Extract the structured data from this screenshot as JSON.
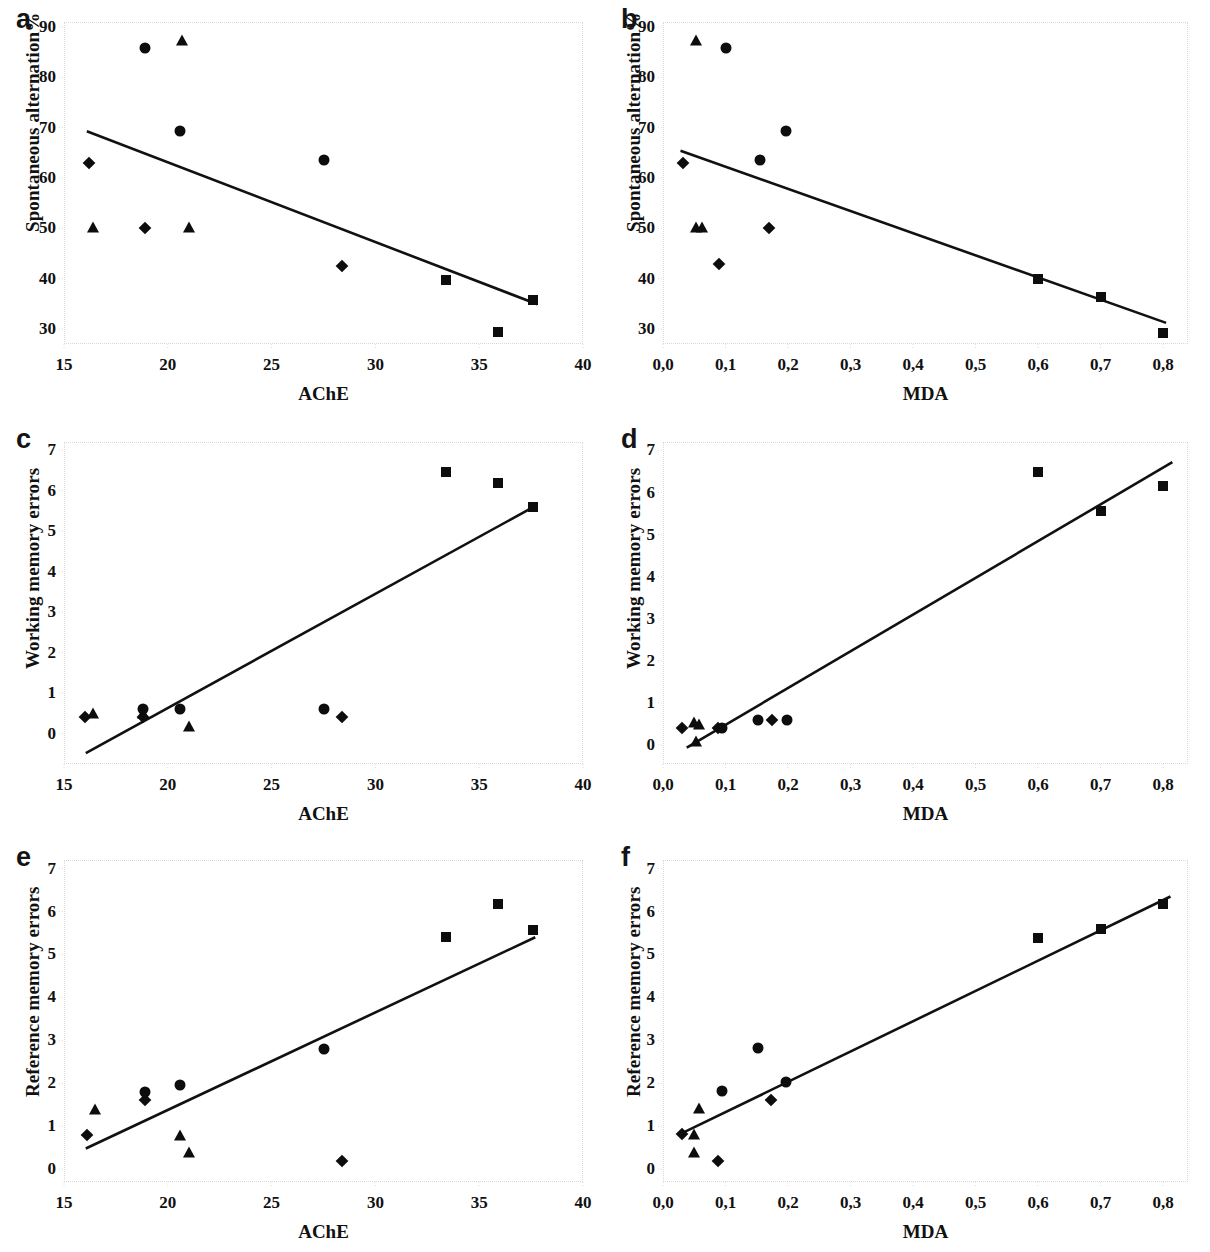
{
  "figure": {
    "panel_count": 6,
    "background_color": "#ffffff",
    "marker_color": "#0d0d0d",
    "line_color": "#111111",
    "frame_color": "#d9d9d9"
  },
  "chart_data": [
    {
      "panel": "a",
      "type": "scatter",
      "title": "",
      "xlabel": "AChE",
      "ylabel": "Spontaneous alternation%",
      "xlim": [
        15,
        40
      ],
      "ylim": [
        27,
        91
      ],
      "xticks": [
        15,
        20,
        25,
        30,
        35,
        40
      ],
      "xticklabels": [
        "15",
        "20",
        "25",
        "30",
        "35",
        "40"
      ],
      "yticks": [
        30,
        40,
        50,
        60,
        70,
        80,
        90
      ],
      "yticklabels": [
        "30",
        "40",
        "50",
        "60",
        "70",
        "80",
        "90"
      ],
      "grid": false,
      "legend": "none",
      "series": [
        {
          "name": "diamond",
          "marker": "diamond",
          "points": [
            [
              16.2,
              63.0
            ],
            [
              18.9,
              50.1
            ],
            [
              28.4,
              42.6
            ]
          ]
        },
        {
          "name": "triangle",
          "marker": "triangle",
          "points": [
            [
              16.4,
              50.2
            ],
            [
              20.7,
              87.4
            ],
            [
              21.0,
              50.2
            ]
          ]
        },
        {
          "name": "circle",
          "marker": "circle",
          "points": [
            [
              18.9,
              85.8
            ],
            [
              20.6,
              69.3
            ],
            [
              27.5,
              63.5
            ]
          ]
        },
        {
          "name": "square",
          "marker": "square",
          "points": [
            [
              33.4,
              39.8
            ],
            [
              35.9,
              29.3
            ],
            [
              37.6,
              35.8
            ]
          ]
        }
      ],
      "trendline": {
        "x1": 16.1,
        "y1": 69.3,
        "x2": 37.8,
        "y2": 34.9
      }
    },
    {
      "panel": "b",
      "type": "scatter",
      "title": "",
      "xlabel": "MDA",
      "ylabel": "Spontaneous alternation%",
      "xlim": [
        0.0,
        0.84
      ],
      "ylim": [
        27,
        91
      ],
      "xticks": [
        0.0,
        0.1,
        0.2,
        0.3,
        0.4,
        0.5,
        0.6,
        0.7,
        0.8
      ],
      "xticklabels": [
        "0,0",
        "0,1",
        "0,2",
        "0,3",
        "0,4",
        "0,5",
        "0,6",
        "0,7",
        "0,8"
      ],
      "yticks": [
        30,
        40,
        50,
        60,
        70,
        80,
        90
      ],
      "yticklabels": [
        "30",
        "40",
        "50",
        "60",
        "70",
        "80",
        "90"
      ],
      "grid": false,
      "legend": "none",
      "series": [
        {
          "name": "diamond",
          "marker": "diamond",
          "points": [
            [
              0.032,
              63.0
            ],
            [
              0.09,
              43.0
            ],
            [
              0.17,
              50.1
            ]
          ]
        },
        {
          "name": "triangle",
          "marker": "triangle",
          "points": [
            [
              0.052,
              87.5
            ],
            [
              0.052,
              50.2
            ],
            [
              0.063,
              50.2
            ]
          ]
        },
        {
          "name": "circle",
          "marker": "circle",
          "points": [
            [
              0.1,
              85.9
            ],
            [
              0.155,
              63.6
            ],
            [
              0.196,
              69.3
            ]
          ]
        },
        {
          "name": "square",
          "marker": "square",
          "points": [
            [
              0.6,
              40.0
            ],
            [
              0.7,
              36.3
            ],
            [
              0.8,
              29.2
            ]
          ]
        }
      ],
      "trendline": {
        "x1": 0.028,
        "y1": 65.4,
        "x2": 0.805,
        "y2": 31.2
      }
    },
    {
      "panel": "c",
      "type": "scatter",
      "title": "",
      "xlabel": "AChE",
      "ylabel": "Working memory errors",
      "xlim": [
        15,
        40
      ],
      "ylim": [
        -0.75,
        7.2
      ],
      "xticks": [
        15,
        20,
        25,
        30,
        35,
        40
      ],
      "xticklabels": [
        "15",
        "20",
        "25",
        "30",
        "35",
        "40"
      ],
      "yticks": [
        0,
        1,
        2,
        3,
        4,
        5,
        6,
        7
      ],
      "yticklabels": [
        "0",
        "1",
        "2",
        "3",
        "4",
        "5",
        "6",
        "7"
      ],
      "grid": false,
      "legend": "none",
      "series": [
        {
          "name": "diamond",
          "marker": "diamond",
          "points": [
            [
              16.0,
              0.4
            ],
            [
              18.8,
              0.4
            ],
            [
              28.4,
              0.4
            ]
          ]
        },
        {
          "name": "triangle",
          "marker": "triangle",
          "points": [
            [
              16.4,
              0.5
            ],
            [
              18.8,
              0.5
            ],
            [
              21.0,
              0.2
            ]
          ]
        },
        {
          "name": "circle",
          "marker": "circle",
          "points": [
            [
              18.8,
              0.6
            ],
            [
              20.6,
              0.6
            ],
            [
              27.5,
              0.6
            ]
          ]
        },
        {
          "name": "square",
          "marker": "square",
          "points": [
            [
              33.4,
              6.45
            ],
            [
              35.9,
              6.2
            ],
            [
              37.6,
              5.6
            ]
          ]
        }
      ],
      "trendline": {
        "x1": 16.05,
        "y1": -0.48,
        "x2": 37.7,
        "y2": 5.62
      }
    },
    {
      "panel": "d",
      "type": "scatter",
      "title": "",
      "xlabel": "MDA",
      "ylabel": "Working memory errors",
      "xlim": [
        0.0,
        0.84
      ],
      "ylim": [
        -0.45,
        7.2
      ],
      "xticks": [
        0.0,
        0.1,
        0.2,
        0.3,
        0.4,
        0.5,
        0.6,
        0.7,
        0.8
      ],
      "xticklabels": [
        "0,0",
        "0,1",
        "0,2",
        "0,3",
        "0,4",
        "0,5",
        "0,6",
        "0,7",
        "0,8"
      ],
      "yticks": [
        0,
        1,
        2,
        3,
        4,
        5,
        6,
        7
      ],
      "yticklabels": [
        "0",
        "1",
        "2",
        "3",
        "4",
        "5",
        "6",
        "7"
      ],
      "grid": false,
      "legend": "none",
      "series": [
        {
          "name": "diamond",
          "marker": "diamond",
          "points": [
            [
              0.03,
              0.4
            ],
            [
              0.088,
              0.4
            ],
            [
              0.175,
              0.6
            ]
          ]
        },
        {
          "name": "triangle",
          "marker": "triangle",
          "points": [
            [
              0.05,
              0.55
            ],
            [
              0.058,
              0.5
            ],
            [
              0.052,
              0.1
            ]
          ]
        },
        {
          "name": "circle",
          "marker": "circle",
          "points": [
            [
              0.095,
              0.4
            ],
            [
              0.152,
              0.6
            ],
            [
              0.198,
              0.6
            ]
          ]
        },
        {
          "name": "square",
          "marker": "square",
          "points": [
            [
              0.6,
              6.48
            ],
            [
              0.7,
              5.55
            ],
            [
              0.8,
              6.15
            ]
          ]
        }
      ],
      "trendline": {
        "x1": 0.038,
        "y1": -0.06,
        "x2": 0.815,
        "y2": 6.72
      }
    },
    {
      "panel": "e",
      "type": "scatter",
      "title": "",
      "xlabel": "AChE",
      "ylabel": "Reference memory errors",
      "xlim": [
        15,
        40
      ],
      "ylim": [
        -0.3,
        7.2
      ],
      "xticks": [
        15,
        20,
        25,
        30,
        35,
        40
      ],
      "xticklabels": [
        "15",
        "20",
        "25",
        "30",
        "35",
        "40"
      ],
      "yticks": [
        0,
        1,
        2,
        3,
        4,
        5,
        6,
        7
      ],
      "yticklabels": [
        "0",
        "1",
        "2",
        "3",
        "4",
        "5",
        "6",
        "7"
      ],
      "grid": false,
      "legend": "none",
      "series": [
        {
          "name": "diamond",
          "marker": "diamond",
          "points": [
            [
              16.1,
              0.8
            ],
            [
              18.9,
              1.6
            ],
            [
              28.4,
              0.2
            ]
          ]
        },
        {
          "name": "triangle",
          "marker": "triangle",
          "points": [
            [
              16.5,
              1.4
            ],
            [
              20.6,
              0.8
            ],
            [
              21.0,
              0.4
            ]
          ]
        },
        {
          "name": "circle",
          "marker": "circle",
          "points": [
            [
              18.9,
              1.8
            ],
            [
              20.6,
              1.97
            ],
            [
              27.5,
              2.8
            ]
          ]
        },
        {
          "name": "square",
          "marker": "square",
          "points": [
            [
              33.4,
              5.4
            ],
            [
              35.9,
              6.17
            ],
            [
              37.6,
              5.58
            ]
          ]
        }
      ],
      "trendline": {
        "x1": 16.05,
        "y1": 0.48,
        "x2": 37.7,
        "y2": 5.4
      }
    },
    {
      "panel": "f",
      "type": "scatter",
      "title": "",
      "xlabel": "MDA",
      "ylabel": "Reference memory errors",
      "xlim": [
        0.0,
        0.84
      ],
      "ylim": [
        -0.3,
        7.2
      ],
      "xticks": [
        0.0,
        0.1,
        0.2,
        0.3,
        0.4,
        0.5,
        0.6,
        0.7,
        0.8
      ],
      "xticklabels": [
        "0,0",
        "0,1",
        "0,2",
        "0,3",
        "0,4",
        "0,5",
        "0,6",
        "0,7",
        "0,8"
      ],
      "yticks": [
        0,
        1,
        2,
        3,
        4,
        5,
        6,
        7
      ],
      "yticklabels": [
        "0",
        "1",
        "2",
        "3",
        "4",
        "5",
        "6",
        "7"
      ],
      "grid": false,
      "legend": "none",
      "series": [
        {
          "name": "diamond",
          "marker": "diamond",
          "points": [
            [
              0.03,
              0.82
            ],
            [
              0.088,
              0.2
            ],
            [
              0.172,
              1.6
            ]
          ]
        },
        {
          "name": "triangle",
          "marker": "triangle",
          "points": [
            [
              0.05,
              0.82
            ],
            [
              0.058,
              1.42
            ],
            [
              0.05,
              0.4
            ]
          ]
        },
        {
          "name": "circle",
          "marker": "circle",
          "points": [
            [
              0.095,
              1.82
            ],
            [
              0.152,
              2.82
            ],
            [
              0.197,
              2.02
            ]
          ]
        },
        {
          "name": "square",
          "marker": "square",
          "points": [
            [
              0.6,
              5.38
            ],
            [
              0.7,
              5.6
            ],
            [
              0.8,
              6.17
            ]
          ]
        }
      ],
      "trendline": {
        "x1": 0.028,
        "y1": 0.82,
        "x2": 0.812,
        "y2": 6.35
      }
    }
  ]
}
